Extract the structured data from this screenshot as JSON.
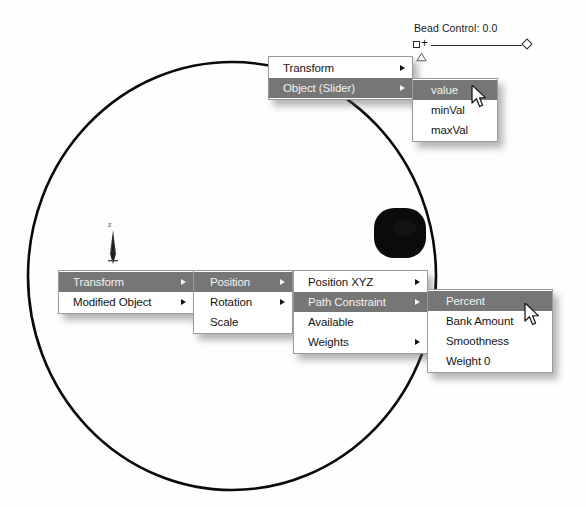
{
  "app": {
    "title": "3ds Max Track View - Path Constraint Percent",
    "background_color": "#ffffff",
    "menu_highlight_color": "#767676",
    "menu_text_color": "#141414",
    "menu_border_color": "#9a9a9a"
  },
  "viewport": {
    "axis_label": "z",
    "bead_label": "bead",
    "path_shape": "circle",
    "path_color": "#000000"
  },
  "slider": {
    "label": "Bead Control: 0.0",
    "name": "Bead Control",
    "value": "0.0",
    "left_icon": "square-plus-icon",
    "right_icon": "diamond-key-icon",
    "marker_icon": "triangle-marker-icon"
  },
  "menus": {
    "top_root": {
      "name": "transform-assign-controller-menu",
      "items": [
        {
          "label": "Transform",
          "has_submenu": true,
          "selected": false
        },
        {
          "label": "Object (Slider)",
          "has_submenu": true,
          "selected": true
        }
      ]
    },
    "top_sub": {
      "name": "slider-object-tracks-menu",
      "items": [
        {
          "label": "value",
          "has_submenu": false,
          "selected": true
        },
        {
          "label": "minVal",
          "has_submenu": false,
          "selected": false
        },
        {
          "label": "maxVal",
          "has_submenu": false,
          "selected": false
        }
      ]
    },
    "bottom_root": {
      "name": "object-transform-menu",
      "items": [
        {
          "label": "Transform",
          "has_submenu": true,
          "selected": true
        },
        {
          "label": "Modified Object",
          "has_submenu": true,
          "selected": false
        }
      ]
    },
    "bottom_sub1": {
      "name": "transform-components-menu",
      "items": [
        {
          "label": "Position",
          "has_submenu": true,
          "selected": true
        },
        {
          "label": "Rotation",
          "has_submenu": true,
          "selected": false
        },
        {
          "label": "Scale",
          "has_submenu": false,
          "selected": false
        }
      ]
    },
    "bottom_sub2": {
      "name": "position-controllers-menu",
      "items": [
        {
          "label": "Position XYZ",
          "has_submenu": true,
          "selected": false
        },
        {
          "label": "Path Constraint",
          "has_submenu": true,
          "selected": true
        },
        {
          "label": "Available",
          "has_submenu": false,
          "selected": false
        },
        {
          "label": "Weights",
          "has_submenu": true,
          "selected": false
        }
      ]
    },
    "bottom_sub3": {
      "name": "path-constraint-params-menu",
      "items": [
        {
          "label": "Percent",
          "has_submenu": false,
          "selected": true
        },
        {
          "label": "Bank Amount",
          "has_submenu": false,
          "selected": false
        },
        {
          "label": "Smoothness",
          "has_submenu": false,
          "selected": false
        },
        {
          "label": "Weight 0",
          "has_submenu": false,
          "selected": false
        }
      ]
    }
  },
  "cursors": [
    {
      "name": "mouse-pointer-top",
      "icon": "arrow-cursor"
    },
    {
      "name": "mouse-pointer-bottom",
      "icon": "arrow-cursor"
    }
  ]
}
